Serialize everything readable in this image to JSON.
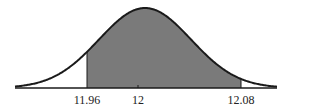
{
  "chart_data": {
    "type": "area",
    "title": "",
    "distribution": "normal",
    "mean": 12,
    "shaded_region": {
      "lower": 11.96,
      "upper": 12.08
    },
    "tick_labels": [
      "11.96",
      "12",
      "12.08"
    ],
    "tick_values": [
      11.96,
      12,
      12.08
    ],
    "xlabel": "",
    "ylabel": "",
    "grid": false,
    "legend": null,
    "colors": {
      "shade": "#7a7a7a",
      "curve": "#1a1a1a",
      "axis": "#1a1a1a"
    }
  },
  "labels": {
    "left": "11.96",
    "mean": "12",
    "right": "12.08"
  }
}
